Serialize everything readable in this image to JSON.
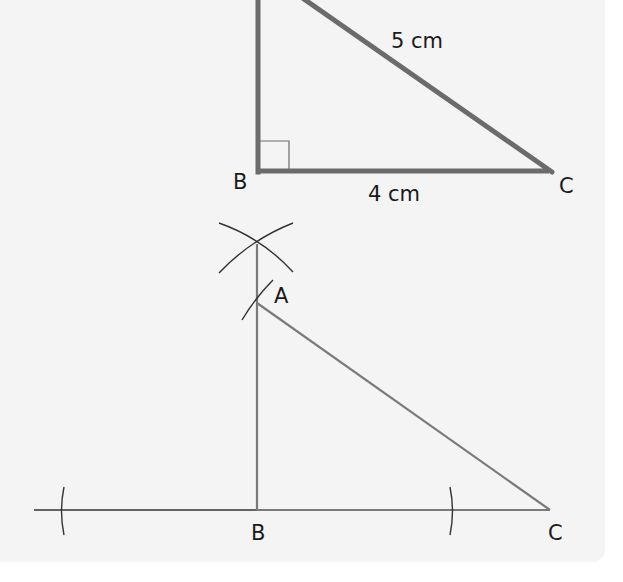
{
  "colors": {
    "panel_background": "#f4f4f4",
    "page_background": "#ffffff",
    "thick_line": "#6b6b6b",
    "thin_line": "#7a7a7a",
    "construction_line": "#333333",
    "label_text": "#1a1a1a"
  },
  "figure_top": {
    "description": "Right-angled triangle ABC with right angle at B",
    "vertices": {
      "A": {
        "label": "A",
        "visible": false
      },
      "B": {
        "label": "B"
      },
      "C": {
        "label": "C"
      }
    },
    "right_angle_marker": "B",
    "sides": {
      "AC": {
        "label": "5 cm"
      },
      "BC": {
        "label": "4 cm"
      }
    }
  },
  "figure_bottom": {
    "description": "Construction of triangle ABC using compass arcs and perpendicular at B",
    "vertices": {
      "A": {
        "label": "A"
      },
      "B": {
        "label": "B"
      },
      "C": {
        "label": "C"
      }
    },
    "construction_marks": [
      "perpendicular-bisector-arcs-above-A",
      "arc-through-A",
      "arc-left-on-baseline",
      "arc-right-on-baseline"
    ]
  }
}
